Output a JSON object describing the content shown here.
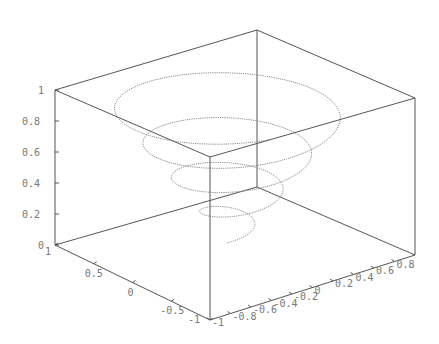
{
  "chart_data": {
    "type": "line",
    "subtype": "3d-parametric-helix",
    "title": "",
    "xlabel": "",
    "ylabel": "",
    "zlabel": "",
    "x_ticks": [
      "-1",
      "-0.8",
      "-0.6",
      "-0.4",
      "-0.2",
      "0",
      "0.2",
      "0.4",
      "0.6",
      "0.8"
    ],
    "y_ticks": [
      "1",
      "0.5",
      "0",
      "-0.5",
      "-1"
    ],
    "z_ticks": [
      "0",
      "0.2",
      "0.4",
      "0.6",
      "0.8",
      "1"
    ],
    "xlim": [
      -1,
      1
    ],
    "ylim": [
      -1,
      1
    ],
    "zlim": [
      0,
      1
    ],
    "grid": false,
    "legend": "none",
    "series": [
      {
        "name": "spiral",
        "style": "dotted",
        "color": "#888888",
        "description": "conical helix: x = t*cos(k*t), y = t*sin(k*t), z = t for t in [0,1], about 4.5 turns",
        "turns": 4.5,
        "t_range": [
          0,
          1
        ]
      }
    ]
  },
  "colors": {
    "axis": "#666666",
    "curve": "#8a8a8a",
    "labels": "#777777",
    "background": "#ffffff"
  }
}
